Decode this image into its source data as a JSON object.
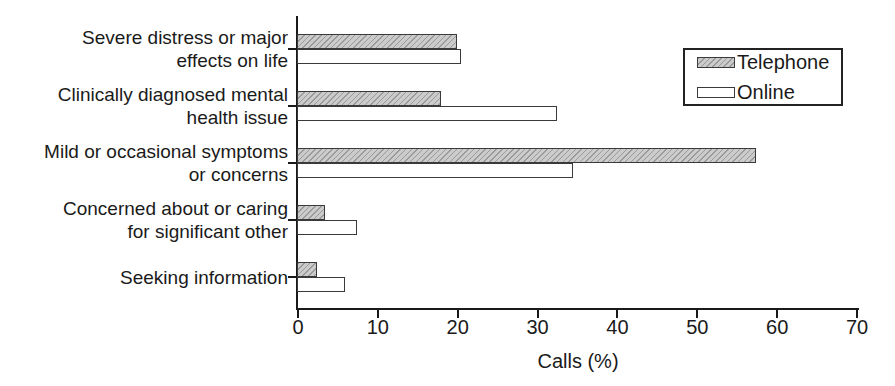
{
  "chart_data": {
    "type": "bar",
    "orientation": "horizontal",
    "title": "",
    "xlabel": "Calls (%)",
    "xlim": [
      0,
      70
    ],
    "xticks": [
      0,
      10,
      20,
      30,
      40,
      50,
      60,
      70
    ],
    "grid": false,
    "legend_position": "top-right",
    "categories": [
      "Severe distress or major effects on life",
      "Clinically diagnosed mental health issue",
      "Mild or occasional symptoms or concerns",
      "Concerned about or caring for significant other",
      "Seeking information"
    ],
    "category_display_lines": [
      [
        "Severe distress or major",
        "effects on life"
      ],
      [
        "Clinically diagnosed mental",
        "health issue"
      ],
      [
        "Mild or occasional symptoms",
        "or concerns"
      ],
      [
        "Concerned about or caring",
        "for significant other"
      ],
      [
        "Seeking information"
      ]
    ],
    "series": [
      {
        "name": "Telephone",
        "fill": "hatch",
        "color": "#cbcbcb",
        "values": [
          20,
          18,
          57.5,
          3.5,
          2.5
        ]
      },
      {
        "name": "Online",
        "fill": "solid",
        "color": "#ffffff",
        "values": [
          20.5,
          32.5,
          34.5,
          7.5,
          6
        ]
      }
    ],
    "colors": {
      "axis": "#1a1a1a",
      "bar_border": "#3a3a3a",
      "text": "#1a1a1a",
      "background": "#ffffff"
    }
  }
}
